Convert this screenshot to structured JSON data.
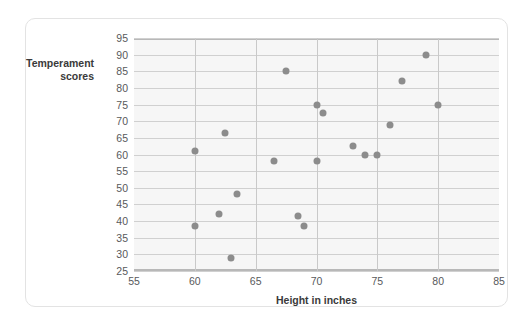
{
  "chart_data": {
    "type": "scatter",
    "title": "",
    "xlabel": "Height in inches",
    "ylabel": "Temperament scores",
    "ylabel_line1": "Temperament",
    "ylabel_line2": "scores",
    "xlim": [
      55,
      85
    ],
    "ylim": [
      25,
      95
    ],
    "xticks": [
      55,
      60,
      65,
      70,
      75,
      80,
      85
    ],
    "yticks": [
      25,
      30,
      35,
      40,
      45,
      50,
      55,
      60,
      65,
      70,
      75,
      80,
      85,
      90,
      95
    ],
    "grid": true,
    "legend": null,
    "marker_color": "#8c8c8c",
    "plot_background": "#f6f6f6",
    "points": [
      {
        "x": 60.0,
        "y": 38.5
      },
      {
        "x": 60.0,
        "y": 61.0
      },
      {
        "x": 62.0,
        "y": 42.0
      },
      {
        "x": 62.5,
        "y": 66.5
      },
      {
        "x": 63.0,
        "y": 29.0
      },
      {
        "x": 63.5,
        "y": 48.0
      },
      {
        "x": 66.5,
        "y": 58.0
      },
      {
        "x": 67.5,
        "y": 85.0
      },
      {
        "x": 68.5,
        "y": 41.5
      },
      {
        "x": 69.0,
        "y": 38.5
      },
      {
        "x": 70.0,
        "y": 75.0
      },
      {
        "x": 70.0,
        "y": 58.0
      },
      {
        "x": 70.5,
        "y": 72.5
      },
      {
        "x": 73.0,
        "y": 62.5
      },
      {
        "x": 74.0,
        "y": 60.0
      },
      {
        "x": 75.0,
        "y": 60.0
      },
      {
        "x": 76.0,
        "y": 69.0
      },
      {
        "x": 77.0,
        "y": 82.0
      },
      {
        "x": 79.0,
        "y": 90.0
      },
      {
        "x": 80.0,
        "y": 75.0
      }
    ]
  }
}
